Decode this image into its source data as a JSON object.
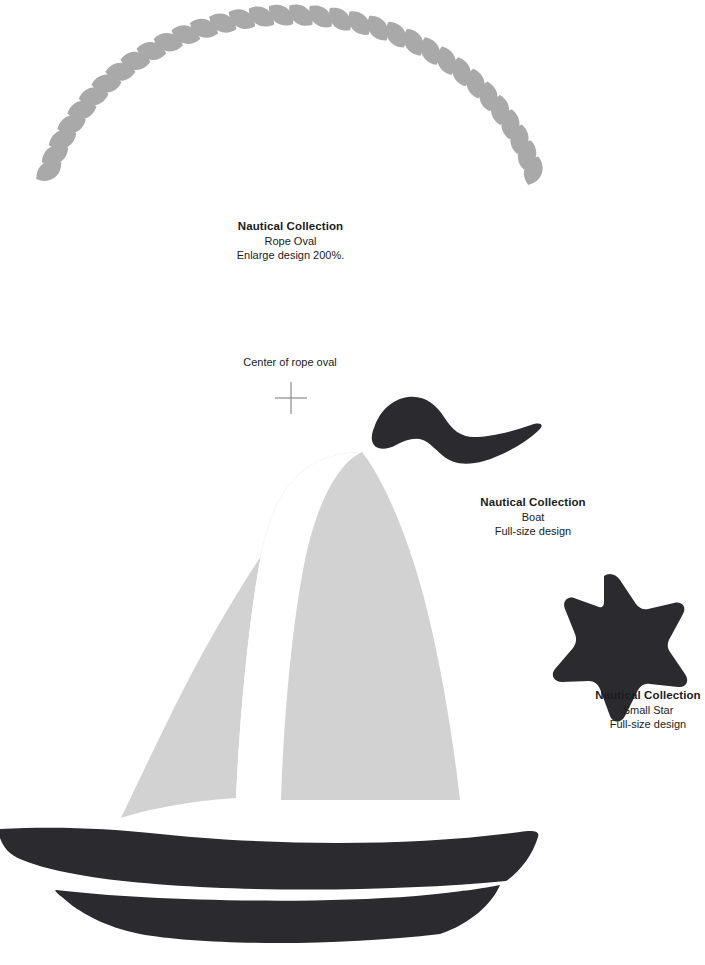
{
  "sheet": {
    "kind": "applique-pattern-sheet",
    "background_color": "#ffffff"
  },
  "colors": {
    "rope_gray": "#a9a9a9",
    "sail_gray": "#d2d2d2",
    "dark_navy": "#2b2b2f",
    "crosshair_gray": "#8c8c8c",
    "text": "#1c1c1c"
  },
  "labels": {
    "rope": {
      "title": "Nautical Collection",
      "line2": "Rope Oval",
      "line3": "Enlarge design 200%."
    },
    "boat": {
      "title": "Nautical Collection",
      "line2": "Boat",
      "line3": "Full-size design"
    },
    "star": {
      "title": "Nautical Collection",
      "line2": "Small Star",
      "line3": "Full-size design"
    },
    "center_marker": {
      "text": "Center of rope oval"
    }
  },
  "shapes": {
    "rope_arc": {
      "name": "rope-oval-arc",
      "segment_count": 34,
      "color": "#a9a9a9"
    },
    "crosshair": {
      "name": "center-crosshair",
      "cx": 291,
      "cy": 398,
      "arm_length": 16,
      "color": "#8c8c8c"
    },
    "pennant_flag": {
      "name": "pennant-flag",
      "color": "#2b2b2f"
    },
    "sail_front": {
      "name": "front-sail",
      "color": "#d2d2d2"
    },
    "sail_back": {
      "name": "back-sail",
      "color": "#d2d2d2"
    },
    "hull_upper": {
      "name": "hull-upper-band",
      "color": "#2b2b2f"
    },
    "hull_lower": {
      "name": "hull-lower-band",
      "color": "#2b2b2f"
    },
    "star": {
      "name": "five-point-star",
      "points": 5,
      "color": "#2b2b2f"
    }
  }
}
